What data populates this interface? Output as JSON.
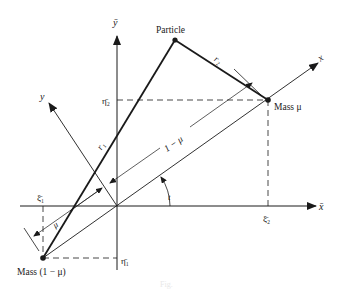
{
  "diagram": {
    "type": "restricted three-body coordinate geometry",
    "labels": {
      "particle": "Particle",
      "mass_mu": "Mass μ",
      "mass_one_minus_mu": "Mass (1 − μ)",
      "r1": "r₁",
      "r2": "r₂",
      "x_axis": "x",
      "y_axis": "y",
      "xbar_axis": "x̄",
      "ybar_axis": "ȳ",
      "xi1": "ξ̄₁",
      "xi2": "ξ̄₂",
      "eta1": "η̄₁",
      "eta2": "η̄₂",
      "dim_mu": "μ",
      "dim_one_minus_mu": "1 − μ",
      "angle": "t"
    },
    "caption": "Fig."
  },
  "colors": {
    "ink": "#1a1a1a",
    "background": "#ffffff"
  }
}
